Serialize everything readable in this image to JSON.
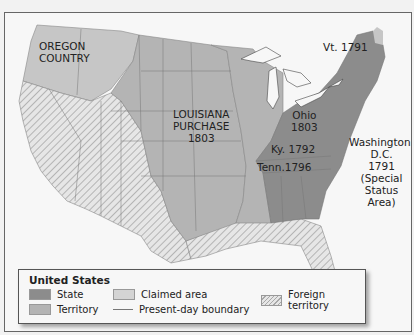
{
  "map": {
    "labels": {
      "oregon": [
        "OREGON",
        "COUNTRY"
      ],
      "louisiana": [
        "LOUISIANA",
        "PURCHASE",
        "1803"
      ],
      "ohio": [
        "Ohio",
        "1803"
      ],
      "vermont": "Vt. 1791",
      "kentucky": "Ky. 1792",
      "tennessee": "Tenn.1796",
      "washington": [
        "Washington,",
        "D.C.",
        "1791",
        "(Special",
        "Status",
        "Area)"
      ]
    },
    "colors": {
      "state": "#8c8c8c",
      "territory": "#b4b4b4",
      "claimed": "#c6c6c6",
      "foreign_bg": "#e6e6e6",
      "foreign_hatch": "#a8a8a8",
      "water": "#f7f7f7",
      "boundary": "#777777"
    }
  },
  "legend": {
    "title": "United States",
    "items": [
      {
        "key": "state",
        "label": "State"
      },
      {
        "key": "territory",
        "label": "Territory"
      },
      {
        "key": "claimed",
        "label": "Claimed area"
      },
      {
        "key": "boundary",
        "label": "Present-day boundary"
      },
      {
        "key": "foreign",
        "label": "Foreign territory"
      }
    ]
  }
}
